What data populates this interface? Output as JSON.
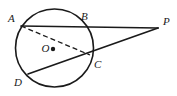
{
  "figure": {
    "kind": "euclidean-geometry-diagram",
    "caption": "",
    "background_color": "#ffffff",
    "stroke_color": "#1a1a1a",
    "label_color": "#1a1a1a",
    "canvas": {
      "width": 177,
      "height": 96
    }
  },
  "circle": {
    "name": "circle-O",
    "center_label": "O",
    "center": {
      "x": 54.5,
      "y": 48
    },
    "radius": 39,
    "stroke_width": 1.6,
    "center_dot_radius": 2.2,
    "center_dot": {
      "x": 53,
      "y": 49
    }
  },
  "points": [
    {
      "id": "A",
      "label": "A",
      "x": 21,
      "y": 26,
      "on_circle": true,
      "label_offset": {
        "dx": -13,
        "dy": -13
      }
    },
    {
      "id": "B",
      "label": "B",
      "x": 82,
      "y": 25,
      "on_circle": true,
      "label_offset": {
        "dx": -1,
        "dy": -14
      }
    },
    {
      "id": "C",
      "label": "C",
      "x": 90,
      "y": 55,
      "on_circle": true,
      "label_offset": {
        "dx": 4,
        "dy": 4
      }
    },
    {
      "id": "D",
      "label": "D",
      "x": 28,
      "y": 74,
      "on_circle": true,
      "label_offset": {
        "dx": -14,
        "dy": 3
      }
    },
    {
      "id": "O",
      "label": "O",
      "x": 54.5,
      "y": 48,
      "on_circle": false,
      "label_offset": {
        "dx": -13,
        "dy": -5
      }
    },
    {
      "id": "P",
      "label": "P",
      "x": 158,
      "y": 28,
      "on_circle": false,
      "label_offset": {
        "dx": 5,
        "dy": -12
      }
    }
  ],
  "segments": [
    {
      "name": "secant-A-B-P",
      "from": "A",
      "to": "P",
      "style": "solid",
      "stroke_width": 1.7,
      "through": [
        "B"
      ]
    },
    {
      "name": "secant-D-C-P",
      "from": "D",
      "to": "P",
      "style": "solid",
      "stroke_width": 1.7,
      "through": [
        "C"
      ]
    },
    {
      "name": "chord-A-C",
      "from": "A",
      "to": "C",
      "style": "dashed",
      "stroke_width": 1.3,
      "dash_pattern": "5,3",
      "through": []
    }
  ],
  "labels": {
    "A": "A",
    "B": "B",
    "C": "C",
    "D": "D",
    "O": "O",
    "P": "P"
  }
}
